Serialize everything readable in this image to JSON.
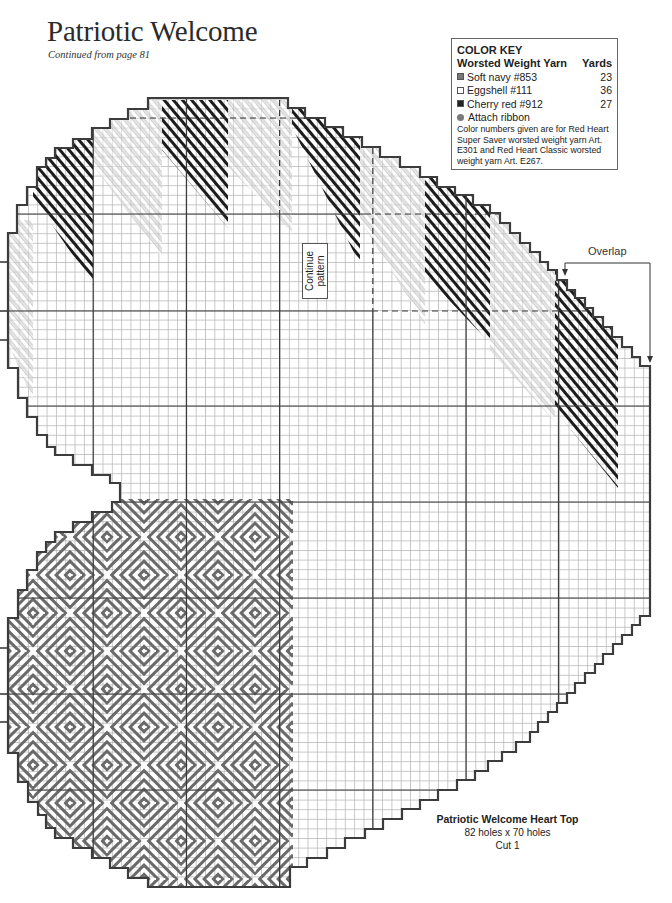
{
  "page": {
    "title": "Patriotic Welcome",
    "subtitle": "Continued from page 81"
  },
  "color_key": {
    "title": "COLOR KEY",
    "yarn_header": "Worsted Weight Yarn",
    "yards_header": "Yards",
    "items": [
      {
        "name": "Soft navy #853",
        "yards": "23",
        "swatch_icon": "navy-square",
        "color": "#777777",
        "swatch_style": "background:#777777"
      },
      {
        "name": "Eggshell #111",
        "yards": "36",
        "swatch_icon": "eggshell-square",
        "color": "#ffffff",
        "swatch_style": "background:#ffffff"
      },
      {
        "name": "Cherry red #912",
        "yards": "27",
        "swatch_icon": "cherry-red-square",
        "color": "#222222",
        "swatch_style": "background:#222222"
      }
    ],
    "ribbon": {
      "label": "Attach ribbon",
      "symbol_icon": "dot"
    },
    "note_lines": [
      "Color numbers given are for Red Heart",
      "Super Saver worsted weight yarn Art.",
      "E301 and Red Heart Classic worsted",
      "weight yarn Art. E267."
    ]
  },
  "chart": {
    "labels": {
      "continue_line1": "Continue",
      "continue_line2": "pattern",
      "overlap": "Overlap"
    },
    "caption": {
      "title": "Patriotic Welcome Heart Top",
      "size": "82 holes x 70 holes",
      "cut": "Cut 1"
    },
    "colors": {
      "grid_minor": "#b4b4b4",
      "grid_major": "#3a3a3a",
      "navy_stitch": "#6a6a6a",
      "cherry_red_stitch": "#1c1c1c",
      "eggshell_stitch": "#9c9c9c"
    }
  }
}
